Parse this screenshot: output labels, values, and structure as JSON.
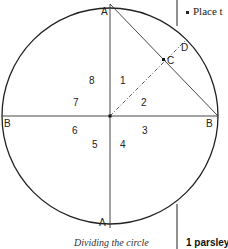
{
  "diagram": {
    "points": {
      "A_top": "A",
      "A_bottom": "A",
      "B_left": "B",
      "B_right": "B",
      "C": "C",
      "D": "D"
    },
    "segments": [
      "1",
      "2",
      "3",
      "4",
      "5",
      "6",
      "7",
      "8"
    ],
    "caption": "Dividing the circle"
  },
  "sidebar": {
    "bullet_text": "Place t",
    "step_label": "1 parsley"
  }
}
